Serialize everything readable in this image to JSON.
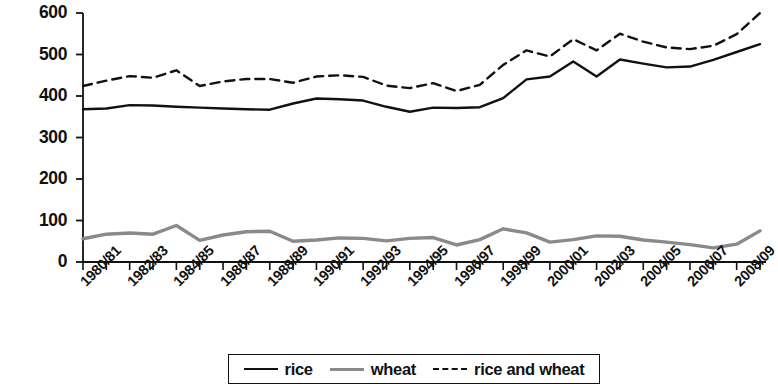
{
  "chart_data": {
    "type": "line",
    "title": "",
    "xlabel": "",
    "ylabel": "grams/person/day",
    "ylim": [
      0,
      600
    ],
    "yticks": [
      0,
      100,
      200,
      300,
      400,
      500,
      600
    ],
    "grid": false,
    "legend_position": "bottom",
    "x": [
      "1980/81",
      "1981/82",
      "1982/83",
      "1983/84",
      "1984/85",
      "1985/86",
      "1986/87",
      "1987/88",
      "1988/89",
      "1989/90",
      "1990/91",
      "1991/92",
      "1992/93",
      "1993/94",
      "1994/95",
      "1995/96",
      "1996/97",
      "1997/98",
      "1998/99",
      "1999/00",
      "2000/01",
      "2001/02",
      "2002/03",
      "2003/04",
      "2004/05",
      "2005/06",
      "2006/07",
      "2007/08",
      "2008/09",
      "2009/10"
    ],
    "xtick_labels": [
      "1980/81",
      "1982/83",
      "1984/85",
      "1986/87",
      "1988/89",
      "1990/91",
      "1992/93",
      "1994/95",
      "1996/97",
      "1998/99",
      "2000/01",
      "2002/03",
      "2004/05",
      "2006/07",
      "2008/09"
    ],
    "series": [
      {
        "name": "rice",
        "style": "solid",
        "color": "#111111",
        "values": [
          368,
          370,
          378,
          377,
          374,
          372,
          370,
          368,
          367,
          382,
          394,
          392,
          389,
          374,
          362,
          372,
          371,
          373,
          395,
          440,
          447,
          483,
          447,
          488,
          478,
          469,
          471,
          487,
          506,
          525
        ]
      },
      {
        "name": "wheat",
        "style": "solid",
        "color": "#8a8a8a",
        "values": [
          56,
          67,
          70,
          67,
          88,
          52,
          65,
          73,
          74,
          50,
          53,
          58,
          57,
          51,
          57,
          59,
          41,
          54,
          80,
          70,
          48,
          54,
          63,
          62,
          53,
          48,
          42,
          34,
          43,
          75
        ]
      },
      {
        "name": "rice and wheat",
        "style": "dashed",
        "color": "#111111",
        "values": [
          424,
          437,
          448,
          444,
          462,
          424,
          435,
          441,
          441,
          432,
          447,
          450,
          446,
          425,
          419,
          431,
          412,
          427,
          475,
          510,
          495,
          537,
          510,
          550,
          531,
          517,
          513,
          521,
          549,
          600
        ]
      }
    ]
  },
  "legend": {
    "items": [
      {
        "label": "rice",
        "style": "solid-black"
      },
      {
        "label": "wheat",
        "style": "solid-gray"
      },
      {
        "label": "rice and wheat",
        "style": "dashed-black"
      }
    ]
  }
}
